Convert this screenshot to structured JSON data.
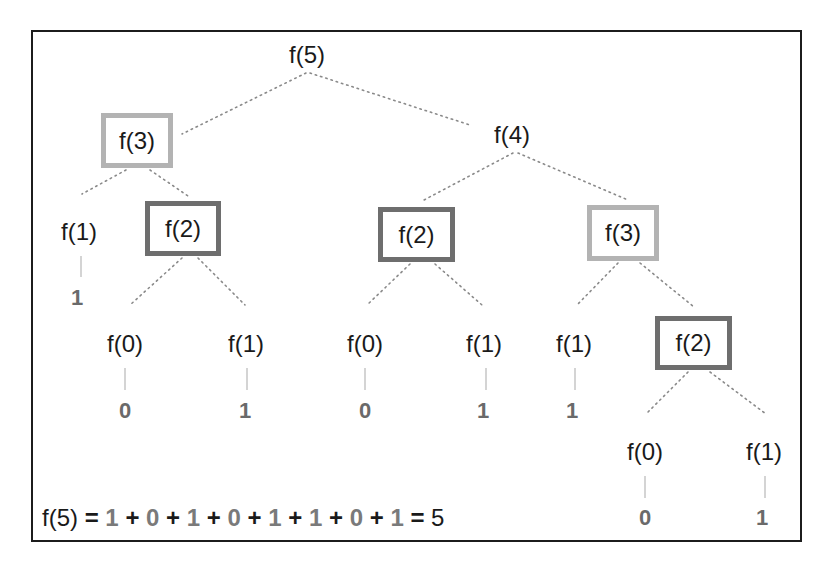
{
  "diagram": {
    "colors": {
      "frame_border": "#1c1c1c",
      "repeated_f3_box": "#b3b3b3",
      "repeated_f2_box": "#6e6e6e",
      "edge": "#8a8a8a",
      "leaf_value": "#6a6a6a"
    },
    "nodes": {
      "root": "f(5)",
      "l1_left": "f(3)",
      "l1_right": "f(4)",
      "l2_a": "f(1)",
      "l2_b": "f(2)",
      "l2_c": "f(2)",
      "l2_d": "f(3)",
      "l3_a": "f(0)",
      "l3_b": "f(1)",
      "l3_c": "f(0)",
      "l3_d": "f(1)",
      "l3_e": "f(1)",
      "l3_f": "f(2)",
      "l4_a": "f(0)",
      "l4_b": "f(1)"
    },
    "leaf_values": {
      "v_l2_a": "1",
      "v_l3_a": "0",
      "v_l3_b": "1",
      "v_l3_c": "0",
      "v_l3_d": "1",
      "v_l3_e": "1",
      "v_l4_a": "0",
      "v_l4_b": "1"
    },
    "equation": {
      "lhs": "f(5)",
      "eq": "=",
      "terms": [
        "1",
        "0",
        "1",
        "0",
        "1",
        "1",
        "0",
        "1"
      ],
      "plus": "+",
      "result": "5"
    }
  }
}
